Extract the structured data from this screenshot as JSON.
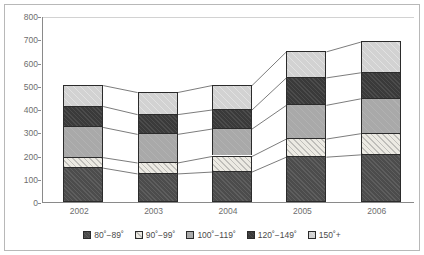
{
  "chart_data": {
    "type": "bar",
    "subtype": "stacked-column",
    "title": "",
    "xlabel": "",
    "ylabel": "",
    "categories": [
      "2002",
      "2003",
      "2004",
      "2005",
      "2006"
    ],
    "ylim": [
      0,
      800
    ],
    "ytick_labels": [
      "0",
      "100",
      "200",
      "300",
      "400",
      "500",
      "600",
      "700",
      "800"
    ],
    "ytick_values": [
      0,
      100,
      200,
      300,
      400,
      500,
      600,
      700,
      800
    ],
    "grid": false,
    "legend_position": "bottom",
    "series": [
      {
        "name": "80˚−89˚",
        "color": "#4c4c4c",
        "values": [
          150,
          125,
          133,
          197,
          207
        ]
      },
      {
        "name": "90˚−99˚",
        "color": "#eceae3",
        "values": [
          45,
          47,
          67,
          78,
          91
        ]
      },
      {
        "name": "100˚−119˚",
        "color": "#a9a9a9",
        "values": [
          130,
          123,
          118,
          145,
          150
        ]
      },
      {
        "name": "120˚−149˚",
        "color": "#3a3a3a",
        "values": [
          90,
          85,
          82,
          118,
          112
        ]
      },
      {
        "name": "150˚+",
        "color": "#d2d2d2",
        "values": [
          90,
          95,
          105,
          112,
          132
        ]
      }
    ],
    "cumulative_tops": [
      [
        150,
        195,
        325,
        415,
        505
      ],
      [
        125,
        172,
        295,
        380,
        475
      ],
      [
        133,
        200,
        318,
        400,
        505
      ],
      [
        197,
        275,
        420,
        538,
        650
      ],
      [
        207,
        298,
        448,
        560,
        692
      ]
    ],
    "totals": [
      505,
      475,
      505,
      650,
      692
    ],
    "connector_lines": true
  },
  "legend": {
    "items": [
      {
        "label": "80˚−89˚"
      },
      {
        "label": "90˚−99˚"
      },
      {
        "label": "100˚−119˚"
      },
      {
        "label": "120˚−149˚"
      },
      {
        "label": "150˚+"
      }
    ]
  }
}
